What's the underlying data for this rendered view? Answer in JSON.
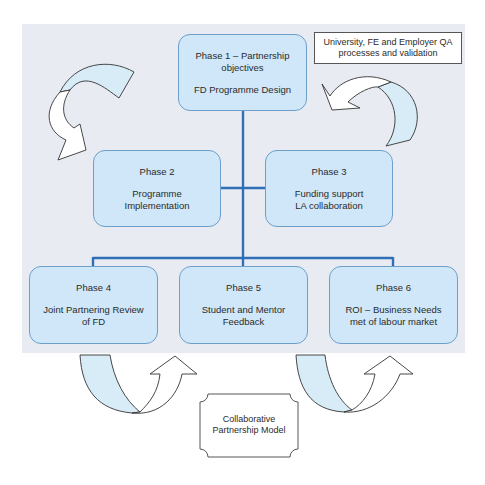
{
  "diagram": {
    "title": "Collaborative Partnership Model",
    "colors": {
      "box_fill": "#cfe7f8",
      "box_border": "#6d9fcb",
      "connector": "#2f6fb5",
      "panel_bg": "#e9ebf3",
      "arrow_fill": "#d8ecf8"
    },
    "phases": [
      {
        "id": "phase-1",
        "title": "Phase 1 – Partnership\nobjectives",
        "description": "FD Programme Design"
      },
      {
        "id": "phase-2",
        "title": "Phase 2",
        "description": "Programme\nImplementation"
      },
      {
        "id": "phase-3",
        "title": "Phase 3",
        "description": "Funding support\nLA collaboration"
      },
      {
        "id": "phase-4",
        "title": "Phase 4",
        "description": "Joint Partnering Review\nof FD"
      },
      {
        "id": "phase-5",
        "title": "Phase 5",
        "description": "Student and Mentor\nFeedback"
      },
      {
        "id": "phase-6",
        "title": "Phase 6",
        "description": "ROI – Business Needs\nmet of labour market"
      }
    ],
    "qa_note": "University, FE and Employer QA\nprocesses and validation",
    "model_label": "Collaborative\nPartnership Model",
    "connections": [
      [
        "phase-1",
        "phase-2"
      ],
      [
        "phase-1",
        "phase-3"
      ],
      [
        "phase-1",
        "phase-4"
      ],
      [
        "phase-1",
        "phase-5"
      ],
      [
        "phase-1",
        "phase-6"
      ]
    ]
  }
}
